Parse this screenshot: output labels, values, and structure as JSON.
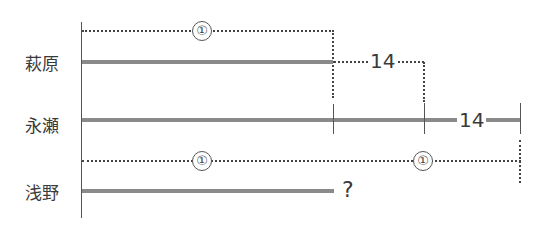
{
  "diagram": {
    "type": "segment-diagram",
    "rows": [
      {
        "name": "萩原",
        "bar_start_x": 81,
        "bar_end_x": 333
      },
      {
        "name": "永瀬",
        "bar_start_x": 81,
        "bar_end_x": 520
      },
      {
        "name": "浅野",
        "bar_start_x": 81,
        "bar_end_x": 334,
        "unknown_label": "?"
      }
    ],
    "annotations": {
      "top_bracket_label": "①",
      "hagiwara_gap_label": "14",
      "nagase_tail_label": "14",
      "bottom_bracket_labels": [
        "①",
        "①"
      ]
    }
  }
}
